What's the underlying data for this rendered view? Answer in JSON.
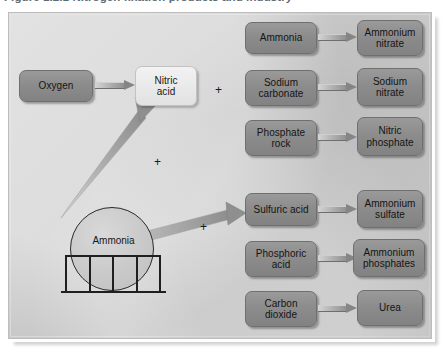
{
  "caption": {
    "text": "Figure 1.2.1   Nitrogen fixation products and industry"
  },
  "figure": {
    "panel_bg": "#cdcdcd",
    "box_dark": "#8c8c8c",
    "box_light": "#eaeaea",
    "border": "#6f6f6f"
  },
  "tank": {
    "label": "Ammonia",
    "name": "ammonia-storage-sphere"
  },
  "primary_flow": {
    "source_label": "Oxygen",
    "target_label": "Nitric\nacid",
    "target_line1": "Nitric",
    "target_line2": "acid"
  },
  "operators": [
    {
      "symbol": "+",
      "name": "plus-sign-nitric-acid-row"
    },
    {
      "symbol": "+",
      "name": "plus-sign-ammonia-to-nitric"
    },
    {
      "symbol": "+",
      "name": "plus-sign-ammonia-to-sulfuric"
    }
  ],
  "reaction_rows": [
    {
      "reactant_line1": "Ammonia",
      "reactant_line2": "",
      "product_line1": "Ammonium",
      "product_line2": "nitrate"
    },
    {
      "reactant_line1": "Sodium",
      "reactant_line2": "carbonate",
      "product_line1": "Sodium",
      "product_line2": "nitrate"
    },
    {
      "reactant_line1": "Phosphate",
      "reactant_line2": "rock",
      "product_line1": "Nitric",
      "product_line2": "phosphate"
    },
    {
      "reactant_line1": "Sulfuric acid",
      "reactant_line2": "",
      "product_line1": "Ammonium",
      "product_line2": "sulfate"
    },
    {
      "reactant_line1": "Phosphoric",
      "reactant_line2": "acid",
      "product_line1": "Ammonium",
      "product_line2": "phosphates"
    },
    {
      "reactant_line1": "Carbon",
      "reactant_line2": "dioxide",
      "product_line1": "Urea",
      "product_line2": ""
    }
  ]
}
